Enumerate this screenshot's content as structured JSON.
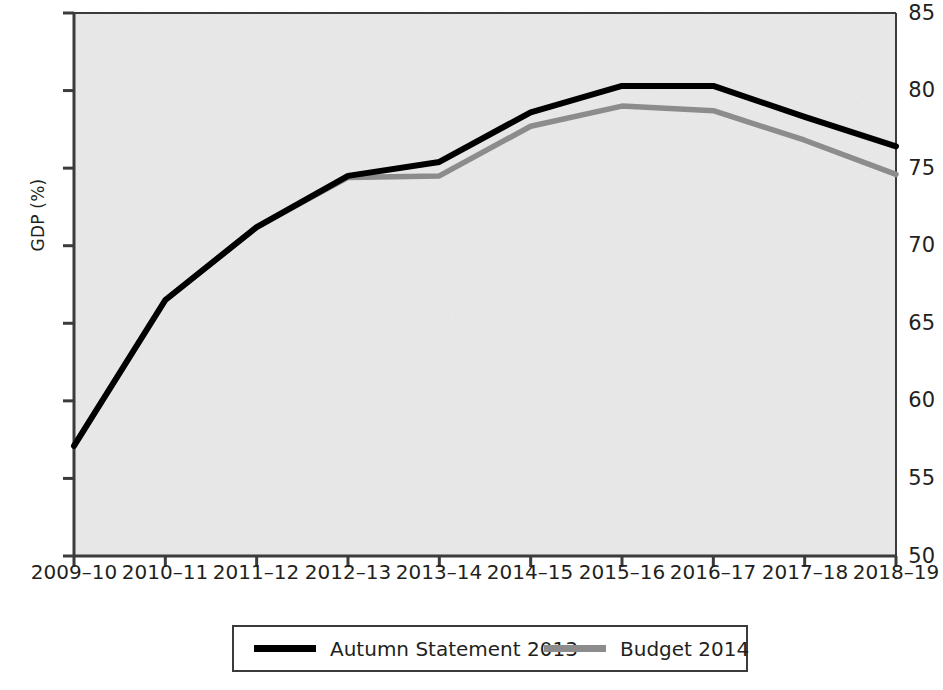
{
  "chart_data": {
    "type": "line",
    "title": "",
    "xlabel": "",
    "ylabel": "GDP (%)",
    "categories": [
      "2009–10",
      "2010–11",
      "2011–12",
      "2012–13",
      "2013–14",
      "2014–15",
      "2015–16",
      "2016–17",
      "2017–18",
      "2018–19"
    ],
    "ylim": [
      50,
      85
    ],
    "yticks": [
      50,
      55,
      60,
      65,
      70,
      75,
      80,
      85
    ],
    "ytick_labels": [
      "50",
      "55",
      "60",
      "65",
      "70",
      "75",
      "80",
      "85"
    ],
    "grid": false,
    "legend_position": "bottom",
    "series": [
      {
        "name": "Autumn Statement 2013",
        "color": "#000000",
        "values": [
          57.1,
          66.5,
          71.2,
          74.5,
          75.4,
          78.6,
          80.3,
          80.3,
          78.3,
          76.4
        ]
      },
      {
        "name": "Budget 2014",
        "color": "#8c8c8c",
        "values": [
          57.1,
          66.5,
          71.2,
          74.4,
          74.5,
          77.7,
          79.0,
          78.7,
          76.8,
          74.6
        ]
      }
    ]
  },
  "axes": {
    "y_axis_label": "GDP (%)",
    "y_tick_labels": [
      "85",
      "80",
      "75",
      "70",
      "65",
      "60",
      "55",
      "50"
    ],
    "x_tick_labels": [
      "2009–10",
      "2010–11",
      "2011–12",
      "2012–13",
      "2013–14",
      "2014–15",
      "2015–16",
      "2016–17",
      "2017–18",
      "2018–19"
    ]
  },
  "legend": {
    "items": [
      {
        "label": "Autumn Statement 2013",
        "color": "#000000"
      },
      {
        "label": "Budget 2014",
        "color": "#8c8c8c"
      }
    ]
  },
  "style": {
    "plot_background": "#e9e9e9",
    "axis_color": "#3b3b3b",
    "text_color": "#231f20"
  }
}
